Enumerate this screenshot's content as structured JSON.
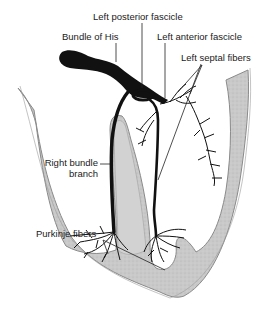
{
  "diagram": {
    "labels": {
      "left_posterior_fascicle": "Left posterior fascicle",
      "bundle_of_his": "Bundle of His",
      "left_anterior_fascicle": "Left anterior fascicle",
      "left_septal_fibers": "Left septal fibers",
      "right_bundle_branch_line1": "Right bundle",
      "right_bundle_branch_line2": "branch",
      "purkinje_fibers": "Purkinje fibers"
    },
    "colors": {
      "myocardium_fill": "#c8c8c8",
      "myocardium_edge": "#8a8a8a",
      "conduction": "#111111",
      "background": "#ffffff",
      "leader_line": "#222222"
    }
  }
}
